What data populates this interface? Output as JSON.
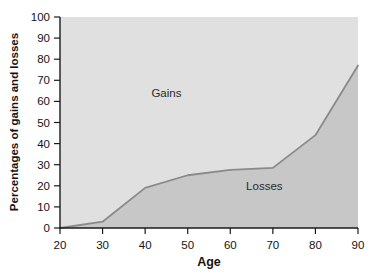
{
  "chart_data": {
    "type": "area",
    "title": "",
    "subtitle": "",
    "xlabel": "Age",
    "ylabel": "Percentages of gains and losses",
    "x": [
      20,
      30,
      40,
      50,
      60,
      70,
      80,
      90
    ],
    "series": [
      {
        "name": "Losses",
        "values": [
          0,
          3,
          19,
          25,
          27.5,
          28.5,
          44,
          77
        ]
      },
      {
        "name": "Gains",
        "values": [
          100,
          97,
          81,
          75,
          72.5,
          71.5,
          56,
          23
        ]
      }
    ],
    "xlim": [
      20,
      90
    ],
    "ylim": [
      0,
      100
    ],
    "xticks": [
      20,
      30,
      40,
      50,
      60,
      70,
      80,
      90
    ],
    "yticks": [
      0,
      10,
      20,
      30,
      40,
      50,
      60,
      70,
      80,
      90,
      100
    ],
    "xtick_labels": [
      "20",
      "30",
      "40",
      "50",
      "60",
      "70",
      "80",
      "90"
    ],
    "ytick_labels": [
      "0",
      "10",
      "20",
      "30",
      "40",
      "50",
      "60",
      "70",
      "80",
      "90",
      "100"
    ],
    "grid": false,
    "legend": "none",
    "annotations": [
      {
        "text": "Gains",
        "x": 45,
        "y": 62
      },
      {
        "text": "Losses",
        "x": 68,
        "y": 18
      }
    ],
    "colors": {
      "gains_fill": "#e0e0e0",
      "losses_fill": "#c7c7c7",
      "curve_line": "#8a8a8a",
      "axis": "#1a1a1a",
      "text": "#141414",
      "background": "#ffffff"
    }
  }
}
